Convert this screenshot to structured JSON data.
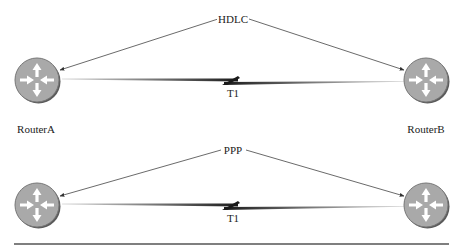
{
  "diagram": {
    "panels": [
      {
        "protocol_label": "HDLC",
        "link_label": "T1",
        "left_router": {
          "name": "RouterA",
          "show_name": true
        },
        "right_router": {
          "name": "RouterB",
          "show_name": true
        }
      },
      {
        "protocol_label": "PPP",
        "link_label": "T1",
        "left_router": {
          "name": "RouterA",
          "show_name": false
        },
        "right_router": {
          "name": "RouterB",
          "show_name": false
        }
      }
    ],
    "colors": {
      "router_fill": "#a9a9a9",
      "router_rim": "#6e6e6e",
      "arrow_fill": "#ffffff",
      "link": "#1a1a1a",
      "pointer_line": "#444444",
      "rule": "#555555"
    },
    "icons": {
      "router": "router-icon",
      "serial_link": "lightning-serial-link-icon"
    }
  }
}
